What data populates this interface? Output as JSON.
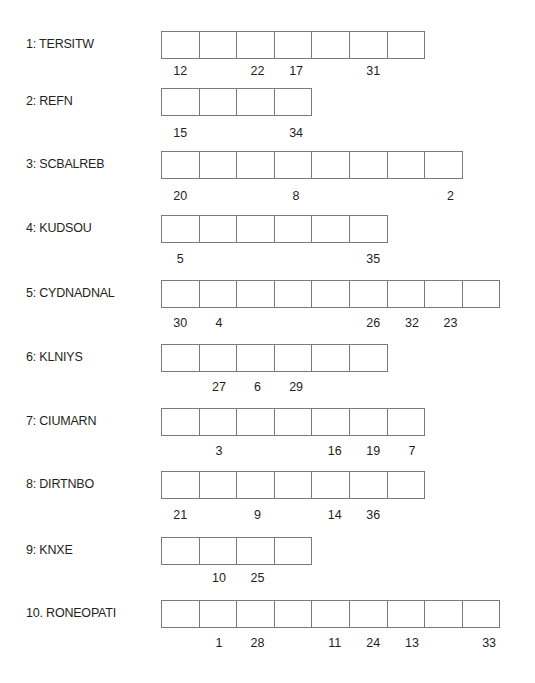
{
  "puzzle": {
    "cell_width": 38.6,
    "boxes_left": 161,
    "rows": [
      {
        "label": "1: TERSITW",
        "cells": 7,
        "top": 31,
        "num_top": 64,
        "numbers": [
          {
            "cell": 0,
            "value": "12"
          },
          {
            "cell": 2,
            "value": "22"
          },
          {
            "cell": 3,
            "value": "17"
          },
          {
            "cell": 5,
            "value": "31"
          }
        ]
      },
      {
        "label": "2: REFN",
        "cells": 4,
        "top": 88,
        "num_top": 126,
        "numbers": [
          {
            "cell": 0,
            "value": "15"
          },
          {
            "cell": 3,
            "value": "34"
          }
        ]
      },
      {
        "label": "3: SCBALREB",
        "cells": 8,
        "top": 151,
        "num_top": 189,
        "numbers": [
          {
            "cell": 0,
            "value": "20"
          },
          {
            "cell": 3,
            "value": "8"
          },
          {
            "cell": 7,
            "value": "2"
          }
        ]
      },
      {
        "label": "4: KUDSOU",
        "cells": 6,
        "top": 215,
        "num_top": 252,
        "numbers": [
          {
            "cell": 0,
            "value": "5"
          },
          {
            "cell": 5,
            "value": "35"
          }
        ]
      },
      {
        "label": "5: CYDNADNAL",
        "cells": 9,
        "top": 280,
        "num_top": 316,
        "numbers": [
          {
            "cell": 0,
            "value": "30"
          },
          {
            "cell": 1,
            "value": "4"
          },
          {
            "cell": 5,
            "value": "26"
          },
          {
            "cell": 6,
            "value": "32"
          },
          {
            "cell": 7,
            "value": "23"
          }
        ]
      },
      {
        "label": "6: KLNIYS",
        "cells": 6,
        "top": 344,
        "num_top": 380,
        "numbers": [
          {
            "cell": 1,
            "value": "27"
          },
          {
            "cell": 2,
            "value": "6"
          },
          {
            "cell": 3,
            "value": "29"
          }
        ]
      },
      {
        "label": "7: CIUMARN",
        "cells": 7,
        "top": 408,
        "num_top": 444,
        "numbers": [
          {
            "cell": 1,
            "value": "3"
          },
          {
            "cell": 4,
            "value": "16"
          },
          {
            "cell": 5,
            "value": "19"
          },
          {
            "cell": 6,
            "value": "7"
          }
        ]
      },
      {
        "label": "8: DIRTNBO",
        "cells": 7,
        "top": 471,
        "num_top": 508,
        "numbers": [
          {
            "cell": 0,
            "value": "21"
          },
          {
            "cell": 2,
            "value": "9"
          },
          {
            "cell": 4,
            "value": "14"
          },
          {
            "cell": 5,
            "value": "36"
          }
        ]
      },
      {
        "label": "9: KNXE",
        "cells": 4,
        "top": 537,
        "num_top": 571,
        "numbers": [
          {
            "cell": 1,
            "value": "10"
          },
          {
            "cell": 2,
            "value": "25"
          }
        ]
      },
      {
        "label": "10. RONEOPATI",
        "cells": 9,
        "top": 600,
        "num_top": 636,
        "numbers": [
          {
            "cell": 1,
            "value": "1"
          },
          {
            "cell": 2,
            "value": "28"
          },
          {
            "cell": 4,
            "value": "11"
          },
          {
            "cell": 5,
            "value": "24"
          },
          {
            "cell": 6,
            "value": "13"
          },
          {
            "cell": 8,
            "value": "33"
          }
        ]
      }
    ]
  }
}
